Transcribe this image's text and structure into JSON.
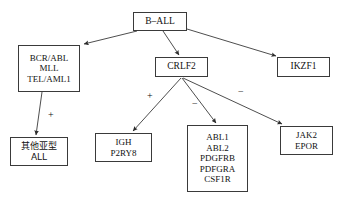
{
  "diagram": {
    "background_color": "#ffffff",
    "line_color": "#3a3a3a",
    "text_color": "#111111",
    "nodes": [
      {
        "id": "b-all",
        "lines": [
          "B–ALL"
        ],
        "x": 133,
        "y": 12,
        "w": 54,
        "h": 19,
        "font_size": 9.5,
        "script": "latin"
      },
      {
        "id": "bcr-abl-group",
        "lines": [
          "BCR/ABL",
          "MLL",
          "TEL/AML1"
        ],
        "x": 18,
        "y": 45,
        "w": 62,
        "h": 47,
        "font_size": 9,
        "script": "latin"
      },
      {
        "id": "crlf2",
        "lines": [
          "CRLF2"
        ],
        "x": 155,
        "y": 57,
        "w": 53,
        "h": 20,
        "font_size": 9.5,
        "script": "latin"
      },
      {
        "id": "ikzf1",
        "lines": [
          "IKZF1"
        ],
        "x": 277,
        "y": 57,
        "w": 53,
        "h": 20,
        "font_size": 9.5,
        "script": "latin"
      },
      {
        "id": "other-subtype-all",
        "lines": [
          "其他亚型",
          "ALL"
        ],
        "x": 10,
        "y": 137,
        "w": 58,
        "h": 29,
        "font_size": 9,
        "script": "cjk"
      },
      {
        "id": "igh-p2ry8",
        "lines": [
          "IGH",
          "P2RY8"
        ],
        "x": 95,
        "y": 133,
        "w": 57,
        "h": 29,
        "font_size": 9,
        "script": "latin"
      },
      {
        "id": "abl-group",
        "lines": [
          "ABL1",
          "ABL2",
          "PDGFRB",
          "PDFGRA",
          "CSF1R"
        ],
        "x": 187,
        "y": 125,
        "w": 61,
        "h": 67,
        "font_size": 9,
        "script": "latin"
      },
      {
        "id": "jak2-epor",
        "lines": [
          "JAK2",
          "EPOR"
        ],
        "x": 280,
        "y": 126,
        "w": 53,
        "h": 29,
        "font_size": 9,
        "script": "latin"
      }
    ],
    "edges": [
      {
        "id": "b-all-to-bcr-abl",
        "from": "b-all",
        "to": "bcr-abl-group",
        "x1": 137,
        "y1": 31,
        "x2": 84,
        "y2": 44,
        "label": ""
      },
      {
        "id": "b-all-to-crlf2",
        "from": "b-all",
        "to": "crlf2",
        "x1": 163,
        "y1": 31,
        "x2": 179,
        "y2": 55,
        "label": ""
      },
      {
        "id": "b-all-to-ikzf1",
        "from": "b-all",
        "to": "ikzf1",
        "x1": 187,
        "y1": 29,
        "x2": 276,
        "y2": 56,
        "label": ""
      },
      {
        "id": "bcr-abl-to-other-subtype",
        "from": "bcr-abl-group",
        "to": "other-subtype-all",
        "x1": 42,
        "y1": 92,
        "x2": 36,
        "y2": 135,
        "label": "+"
      },
      {
        "id": "crlf2-to-igh",
        "from": "crlf2",
        "to": "igh-p2ry8",
        "x1": 181,
        "y1": 78,
        "x2": 133,
        "y2": 131,
        "label": "+"
      },
      {
        "id": "crlf2-to-abl-group",
        "from": "crlf2",
        "to": "abl-group",
        "x1": 182,
        "y1": 78,
        "x2": 216,
        "y2": 123,
        "label": "−"
      },
      {
        "id": "crlf2-to-jak2",
        "from": "crlf2",
        "to": "jak2-epor",
        "x1": 183,
        "y1": 78,
        "x2": 282,
        "y2": 124,
        "label": "−"
      }
    ],
    "edge_labels": [
      {
        "id": "label-plus-left",
        "text": "+",
        "x": 48,
        "y": 110,
        "font_size": 10
      },
      {
        "id": "label-plus-crlf2",
        "text": "+",
        "x": 147,
        "y": 91,
        "font_size": 10
      },
      {
        "id": "label-minus-abl",
        "text": "−",
        "x": 192,
        "y": 99,
        "font_size": 10
      },
      {
        "id": "label-minus-jak2",
        "text": "−",
        "x": 238,
        "y": 87,
        "font_size": 10
      }
    ]
  }
}
